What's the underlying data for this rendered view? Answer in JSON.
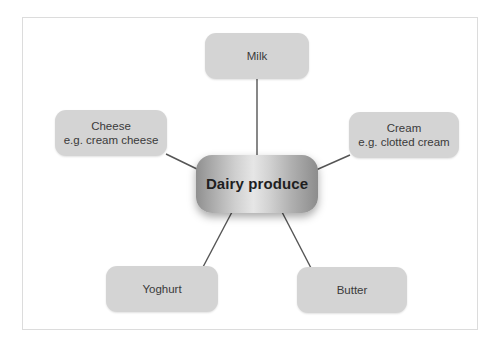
{
  "diagram": {
    "title": "Dairy produce",
    "type": "spider-mind-map",
    "center": {
      "id": "dairy-produce",
      "label": "Dairy produce"
    },
    "nodes": [
      {
        "id": "milk",
        "label": "Milk",
        "detail": "",
        "position": "top"
      },
      {
        "id": "cheese",
        "label": "Cheese",
        "detail": "e.g. cream cheese",
        "position": "left"
      },
      {
        "id": "cream",
        "label": "Cream",
        "detail": "e.g. clotted cream",
        "position": "right"
      },
      {
        "id": "yoghurt",
        "label": "Yoghurt",
        "detail": "",
        "position": "bottom-left"
      },
      {
        "id": "butter",
        "label": "Butter",
        "detail": "",
        "position": "bottom-right"
      }
    ],
    "connections": [
      {
        "from": "dairy-produce",
        "to": "milk"
      },
      {
        "from": "dairy-produce",
        "to": "cheese"
      },
      {
        "from": "dairy-produce",
        "to": "cream"
      },
      {
        "from": "dairy-produce",
        "to": "yoghurt"
      },
      {
        "from": "dairy-produce",
        "to": "butter"
      }
    ],
    "colors": {
      "canvas": "#ffffff",
      "frame_border": "#dcdcdc",
      "node_fill": "#d4d4d4",
      "node_text": "#3a3a3a",
      "center_text": "#1f1f1f",
      "connector": "#555555"
    }
  }
}
